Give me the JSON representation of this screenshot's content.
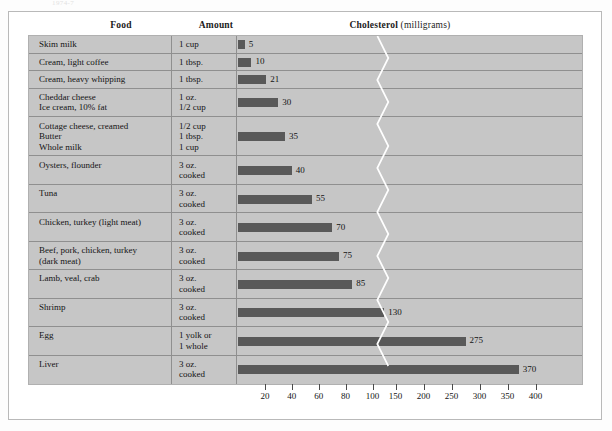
{
  "top_caption": "1974-7",
  "headers": {
    "food": "Food",
    "amount": "Amount",
    "cholesterol_title": "Cholesterol",
    "cholesterol_unit": "(milligrams)"
  },
  "chart_data": {
    "type": "bar",
    "title": "Cholesterol (milligrams)",
    "xlabel": "Cholesterol (milligrams)",
    "ylabel": "Food",
    "orientation": "horizontal",
    "grid": false,
    "legend": "none",
    "axis_break": {
      "after": 100,
      "before": 150
    },
    "xticks": [
      20,
      40,
      60,
      80,
      100,
      150,
      200,
      250,
      300,
      350,
      400
    ],
    "xtick_labels": [
      "20",
      "40",
      "60",
      "80",
      "100",
      "150",
      "200",
      "250",
      "300",
      "350",
      "400"
    ],
    "xlim": [
      0,
      400
    ],
    "categories": [
      "Skim milk",
      "Cream, light coffee",
      "Cream, heavy whipping",
      "Cheddar cheese / Ice cream, 10% fat",
      "Cottage cheese, creamed / Butter / Whole milk",
      "Oysters, flounder",
      "Tuna",
      "Chicken, turkey (light meat)",
      "Beef, pork, chicken, turkey (dark meat)",
      "Lamb, veal, crab",
      "Shrimp",
      "Egg",
      "Liver"
    ],
    "values": [
      5,
      10,
      21,
      30,
      35,
      40,
      55,
      70,
      75,
      85,
      130,
      275,
      370
    ]
  },
  "rows": [
    {
      "food_lines": [
        "Skim milk"
      ],
      "amount_lines": [
        "1 cup"
      ],
      "value": 5,
      "value_label": "5"
    },
    {
      "food_lines": [
        "Cream, light coffee"
      ],
      "amount_lines": [
        "1 tbsp."
      ],
      "value": 10,
      "value_label": "10"
    },
    {
      "food_lines": [
        "Cream, heavy whipping"
      ],
      "amount_lines": [
        "1 tbsp."
      ],
      "value": 21,
      "value_label": "21"
    },
    {
      "food_lines": [
        "Cheddar cheese",
        "Ice cream, 10% fat"
      ],
      "amount_lines": [
        "1 oz.",
        "1/2 cup"
      ],
      "value": 30,
      "value_label": "30"
    },
    {
      "food_lines": [
        "Cottage cheese, creamed",
        "Butter",
        "Whole milk"
      ],
      "amount_lines": [
        "1/2 cup",
        "1 tbsp.",
        "1 cup"
      ],
      "value": 35,
      "value_label": "35"
    },
    {
      "food_lines": [
        "Oysters, flounder"
      ],
      "amount_lines": [
        "3 oz.",
        "cooked"
      ],
      "value": 40,
      "value_label": "40"
    },
    {
      "food_lines": [
        "Tuna"
      ],
      "amount_lines": [
        "3 oz.",
        "cooked"
      ],
      "value": 55,
      "value_label": "55"
    },
    {
      "food_lines": [
        "Chicken, turkey (light meat)"
      ],
      "amount_lines": [
        "3 oz.",
        "cooked"
      ],
      "value": 70,
      "value_label": "70"
    },
    {
      "food_lines": [
        "Beef, pork, chicken, turkey",
        "(dark meat)"
      ],
      "amount_lines": [
        "3 oz.",
        "cooked"
      ],
      "value": 75,
      "value_label": "75"
    },
    {
      "food_lines": [
        "Lamb, veal, crab"
      ],
      "amount_lines": [
        "3 oz.",
        "cooked"
      ],
      "value": 85,
      "value_label": "85"
    },
    {
      "food_lines": [
        "Shrimp"
      ],
      "amount_lines": [
        "3 oz.",
        "cooked"
      ],
      "value": 130,
      "value_label": "130"
    },
    {
      "food_lines": [
        "Egg"
      ],
      "amount_lines": [
        "1 yolk or",
        "1 whole"
      ],
      "value": 275,
      "value_label": "275"
    },
    {
      "food_lines": [
        "Liver"
      ],
      "amount_lines": [
        "3 oz.",
        "cooked"
      ],
      "value": 370,
      "value_label": "370"
    }
  ],
  "colors": {
    "panel_background": "#c6c6c6",
    "bar_fill": "#595959",
    "grid_line": "#8f8f8f",
    "frame_border": "#b9b9b9",
    "break_line": "#ffffff",
    "text": "#141414"
  }
}
